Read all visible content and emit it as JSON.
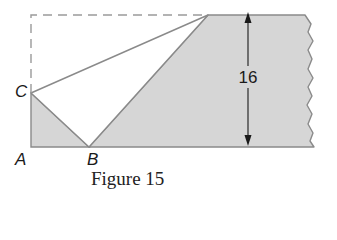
{
  "figure": {
    "caption": "Figure 15",
    "labels": {
      "A": "A",
      "B": "B",
      "C": "C",
      "dimension": "16"
    },
    "points": {
      "A": [
        31,
        146
      ],
      "B": [
        89,
        146
      ],
      "C": [
        31,
        93
      ],
      "top_left_corner": [
        31,
        15
      ],
      "fold_top": [
        208,
        15
      ]
    },
    "colors": {
      "paper_fill": "#d6d6d6",
      "edge_stroke": "#8a8a8a",
      "dashed_stroke": "#9a9a9a",
      "arrow_stroke": "#1a1a1a",
      "background": "#ffffff"
    }
  }
}
